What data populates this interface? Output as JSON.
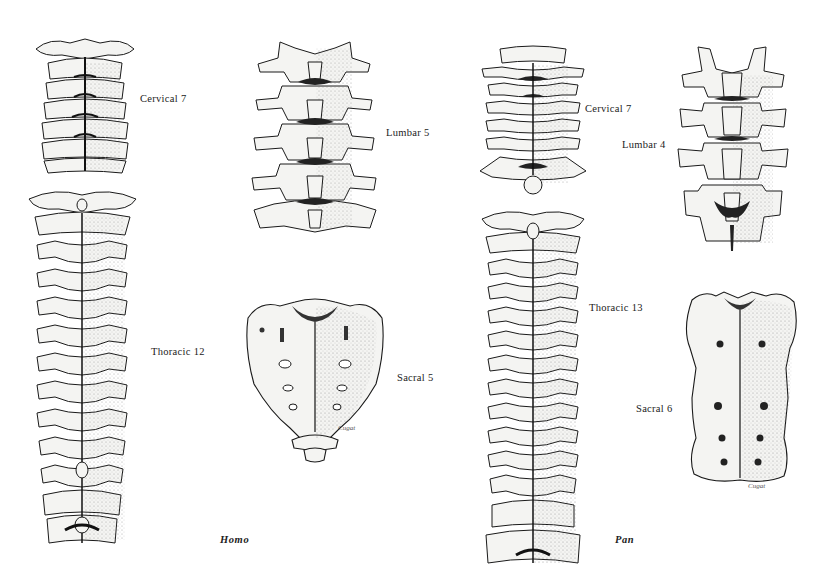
{
  "figure": {
    "colors": {
      "ink": "#1a1a1a",
      "bone_fill": "#f4f4f2",
      "shade": "#9a9a9a",
      "background": "#ffffff"
    }
  },
  "homo": {
    "genus_label": "Homo",
    "sections": [
      {
        "id": "cervical",
        "label": "Cervical 7",
        "count": 7
      },
      {
        "id": "thoracic",
        "label": "Thoracic 12",
        "count": 12
      },
      {
        "id": "lumbar",
        "label": "Lumbar 5",
        "count": 5
      },
      {
        "id": "sacral",
        "label": "Sacral 5",
        "count": 5
      }
    ]
  },
  "pan": {
    "genus_label": "Pan",
    "sections": [
      {
        "id": "cervical",
        "label": "Cervical 7",
        "count": 7
      },
      {
        "id": "thoracic",
        "label": "Thoracic 13",
        "count": 13
      },
      {
        "id": "lumbar",
        "label": "Lumbar 4",
        "count": 4
      },
      {
        "id": "sacral",
        "label": "Sacral 6",
        "count": 6
      }
    ]
  },
  "signatures": {
    "homo_sacrum": "Cugat",
    "pan_sacrum": "Cugat"
  }
}
